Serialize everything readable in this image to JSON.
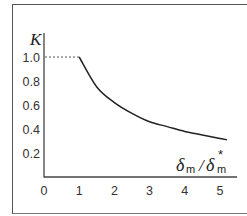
{
  "chart_data": {
    "type": "line",
    "title": "",
    "xlabel": "δm/δm*",
    "ylabel": "K",
    "x_ticks": [
      "0",
      "1",
      "2",
      "3",
      "4",
      "5"
    ],
    "y_ticks": [
      "0.2",
      "0.4",
      "0.6",
      "0.8",
      "1.0"
    ],
    "xlim": [
      0,
      5.3
    ],
    "ylim": [
      0,
      1.2
    ],
    "grid": false,
    "legend": null,
    "annotations": [
      "dashed reference line at K = 1.0 from x = 0 to x = 1"
    ],
    "series": [
      {
        "name": "K",
        "x": [
          1.0,
          1.5,
          2.0,
          2.5,
          3.0,
          3.5,
          4.0,
          4.5,
          5.0,
          5.2
        ],
        "y": [
          1.0,
          0.75,
          0.62,
          0.53,
          0.46,
          0.42,
          0.38,
          0.35,
          0.32,
          0.31
        ]
      }
    ]
  },
  "axis": {
    "y_label_main": "K",
    "x_label_num": "δ",
    "x_label_num_sub": "m",
    "x_label_slash": "/",
    "x_label_den": "δ",
    "x_label_den_sub": "m",
    "x_label_den_sup": "*"
  }
}
